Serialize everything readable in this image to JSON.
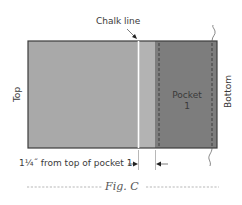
{
  "figure": {
    "caption": "Fig. C",
    "colors": {
      "fabric_light": "#a9a9a9",
      "chalk_band": "#b4b4b4",
      "pocket": "#7d7d7d",
      "outline": "#3c3c3c",
      "chalk_line": "#ffffff",
      "stitch": "#2e2e2e"
    }
  },
  "labels": {
    "chalk_line": "Chalk line",
    "top": "Top",
    "bottom": "Bottom",
    "pocket_line1": "Pocket",
    "pocket_line2": "1",
    "measurement": "1¼˝ from top of pocket 1"
  }
}
